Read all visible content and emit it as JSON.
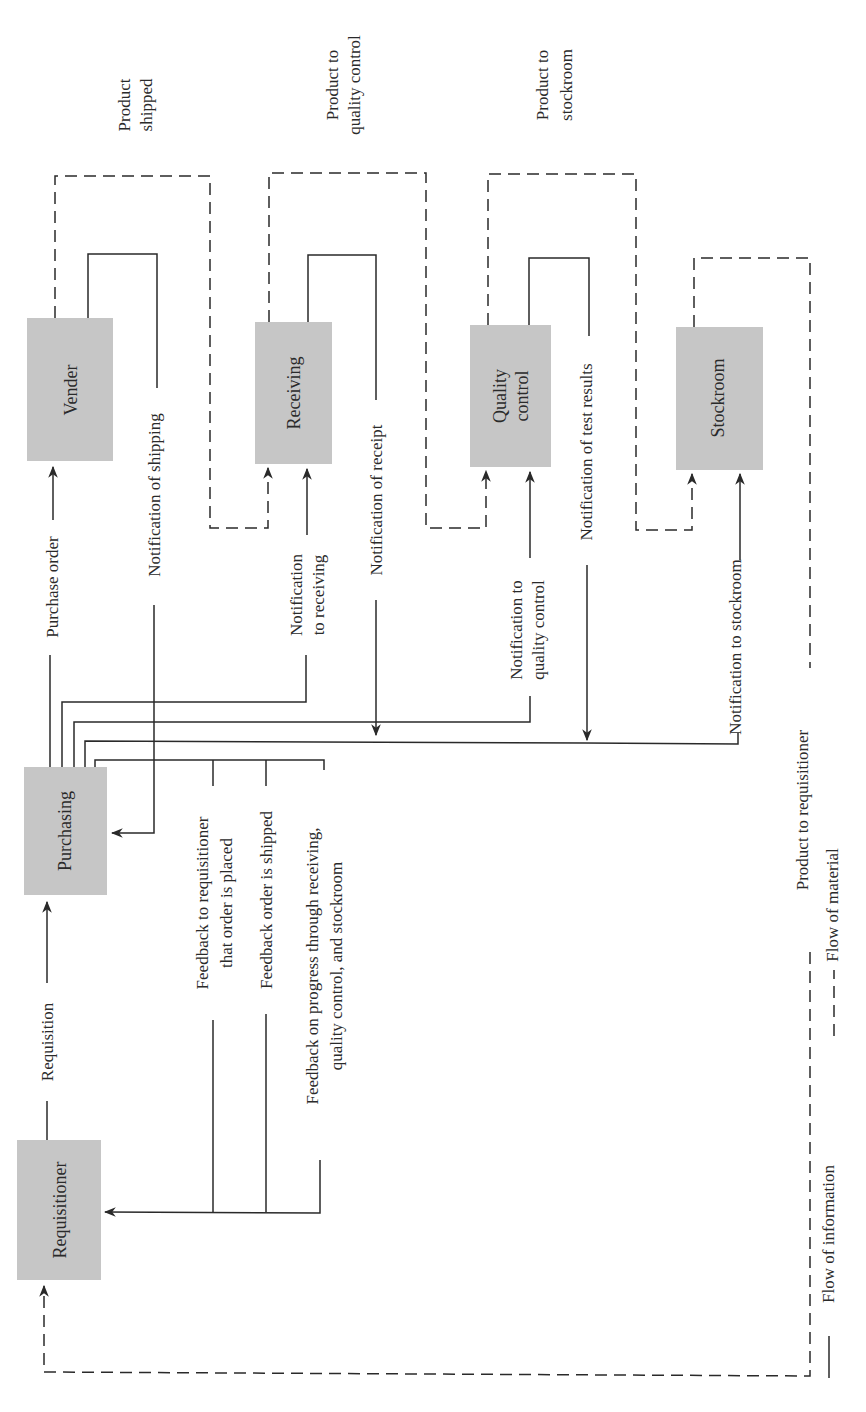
{
  "nodes": {
    "vender": "Vender",
    "receiving": "Receiving",
    "quality_control": [
      "Quality",
      "control"
    ],
    "stockroom": "Stockroom",
    "purchasing": "Purchasing",
    "requisitioner": "Requisitioner"
  },
  "material_flows": {
    "product_shipped": [
      "Product",
      "shipped"
    ],
    "product_to_qc": [
      "Product to",
      "quality control"
    ],
    "product_to_stockroom": [
      "Product to",
      "stockroom"
    ],
    "product_to_requisitioner": "Product to requisitioner"
  },
  "information_flows": {
    "requisition": "Requisition",
    "purchase_order": "Purchase order",
    "notification_of_shipping": "Notification of shipping",
    "notification_to_receiving": [
      "Notification",
      "to receiving"
    ],
    "notification_of_receipt": "Notification of receipt",
    "notification_to_qc": [
      "Notification to",
      "quality control"
    ],
    "notification_of_test_results": "Notification of test results",
    "notification_to_stockroom": "Notification to stockroom",
    "feedback_order_placed": [
      "Feedback to requisitioner",
      "that order is placed"
    ],
    "feedback_order_shipped": "Feedback order is shipped",
    "feedback_progress": [
      "Feedback on progress through  receiving,",
      "quality control, and stockroom"
    ]
  },
  "legend": {
    "information": "Flow of information",
    "material": "Flow of material"
  },
  "colors": {
    "box_fill": "#c6c6c6",
    "line": "#2a2a2a",
    "background": "#ffffff"
  }
}
